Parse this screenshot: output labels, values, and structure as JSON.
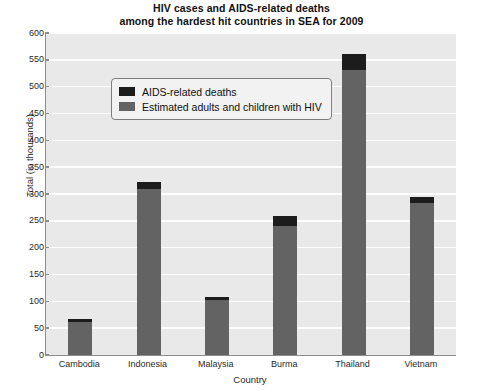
{
  "chart_data": {
    "type": "bar",
    "title": "HIV cases and AIDS-related deaths among the hardest hit countries in SEA for 2009",
    "title_line1": "HIV cases and AIDS-related deaths",
    "title_line2": "among the hardest hit countries in SEA for 2009",
    "xlabel": "Country",
    "ylabel": "Total (in thousands)",
    "ylim": [
      0,
      600
    ],
    "ytick_step": 50,
    "grid": true,
    "stacked": true,
    "legend_position": "top-left inside plot",
    "categories": [
      "Cambodia",
      "Indonesia",
      "Malaysia",
      "Burma",
      "Thailand",
      "Vietnam"
    ],
    "ytick_labels": [
      "600",
      "550",
      "500",
      "450",
      "400",
      "350",
      "300",
      "250",
      "200",
      "150",
      "100",
      "50",
      "0"
    ],
    "ytick_values": [
      600,
      550,
      500,
      450,
      400,
      350,
      300,
      250,
      200,
      150,
      100,
      50,
      0
    ],
    "series": [
      {
        "name": "AIDS-related deaths",
        "color": "#1c1c1c",
        "values": [
          6,
          12,
          6,
          18,
          28,
          11
        ]
      },
      {
        "name": "Estimated adults and children with HIV",
        "color": "#636363",
        "values": [
          61,
          310,
          102,
          241,
          532,
          283
        ]
      }
    ],
    "totals": [
      67,
      322,
      108,
      259,
      560,
      294
    ]
  },
  "legend": {
    "entries": [
      {
        "label": "AIDS-related deaths",
        "color": "#1c1c1c"
      },
      {
        "label": "Estimated adults and children with HIV",
        "color": "#636363"
      }
    ]
  },
  "colors": {
    "plot_background": "#e9e9e9",
    "gridline": "#fdfdfd",
    "axis": "#8c8c8c",
    "page_background": "#ffffff",
    "deaths": "#1c1c1c",
    "hiv": "#636363"
  }
}
